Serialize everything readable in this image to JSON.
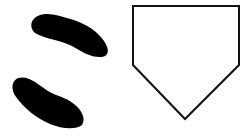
{
  "illustration": {
    "title": "Batter footprints beside home plate",
    "background": "#ffffff",
    "elements": [
      {
        "name": "upper-footprint",
        "color": "#000000"
      },
      {
        "name": "lower-footprint",
        "color": "#000000"
      },
      {
        "name": "home-plate",
        "stroke": "#111111",
        "fill": "#ffffff"
      }
    ]
  }
}
